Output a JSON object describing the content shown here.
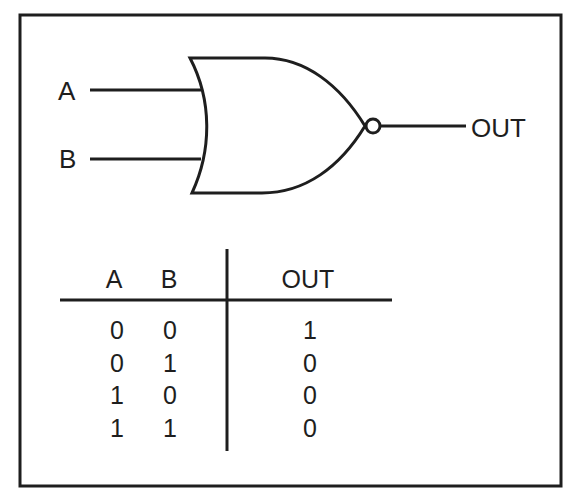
{
  "gate": {
    "type": "NOR",
    "inputs": [
      {
        "label": "A"
      },
      {
        "label": "B"
      }
    ],
    "output": {
      "label": "OUT"
    }
  },
  "truth_table": {
    "headers": [
      "A",
      "B",
      "OUT"
    ],
    "rows": [
      [
        "0",
        "0",
        "1"
      ],
      [
        "0",
        "1",
        "0"
      ],
      [
        "1",
        "0",
        "0"
      ],
      [
        "1",
        "1",
        "0"
      ]
    ]
  },
  "colors": {
    "stroke": "#1e1e1e",
    "background": "#ffffff"
  }
}
